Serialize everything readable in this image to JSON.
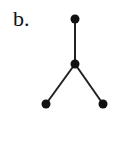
{
  "figure": {
    "label": "b.",
    "colors": {
      "node": "#111111",
      "edge": "#222222",
      "background": "#ffffff"
    },
    "nodes": [
      {
        "id": "top",
        "x": 75,
        "y": 19
      },
      {
        "id": "center",
        "x": 75,
        "y": 64
      },
      {
        "id": "bottom-left",
        "x": 46,
        "y": 104
      },
      {
        "id": "bottom-right",
        "x": 103,
        "y": 104
      }
    ],
    "edges": [
      {
        "from": "top",
        "to": "center"
      },
      {
        "from": "center",
        "to": "bottom-left"
      },
      {
        "from": "center",
        "to": "bottom-right"
      }
    ],
    "node_radius": 4.5
  }
}
